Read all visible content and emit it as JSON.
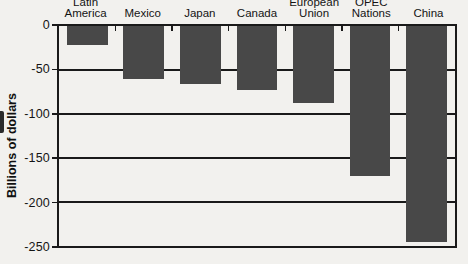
{
  "figure": {
    "background_color": "#f2f1ee",
    "line_color": "#1a1a1a"
  },
  "chart_data": {
    "type": "bar",
    "title": "",
    "xlabel": "",
    "ylabel": "Billions of dollars",
    "categories": [
      "Latin America",
      "Mexico",
      "Japan",
      "Canada",
      "European Union",
      "OPEC Nations",
      "China"
    ],
    "category_label_lines": [
      [
        "Latin",
        "America"
      ],
      [
        "Mexico"
      ],
      [
        "Japan"
      ],
      [
        "Canada"
      ],
      [
        "European",
        "Union"
      ],
      [
        "OPEC",
        "Nations"
      ],
      [
        "China"
      ]
    ],
    "values": [
      -22,
      -60,
      -66,
      -73,
      -88,
      -170,
      -246
    ],
    "unit": "billions of dollars",
    "ylim": [
      -250,
      0
    ],
    "yticks": [
      0,
      -50,
      -100,
      -150,
      -200,
      -250
    ],
    "ytick_labels": [
      "0",
      "-50",
      "-100",
      "-150",
      "-200",
      "-250"
    ],
    "grid": true,
    "legend": false,
    "bar_color": "#484848"
  }
}
